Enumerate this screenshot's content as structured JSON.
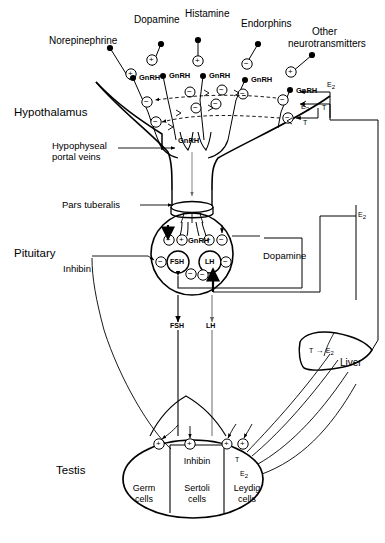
{
  "figure": {
    "type": "diagram",
    "organs": {
      "hypothalamus": "Hypothalamus",
      "pituitary": "Pituitary",
      "testis": "Testis",
      "liver": "Liver"
    },
    "neurotransmitters": [
      "Norepinephrine",
      "Dopamine",
      "Histamine",
      "Endorphins",
      "Other\nneurotransmitters"
    ],
    "nt_labels": {
      "norepinephrine": "Norepinephrine",
      "dopamine": "Dopamine",
      "histamine": "Histamine",
      "endorphins": "Endorphins",
      "other_line1": "Other",
      "other_line2": "neurotransmitters"
    },
    "annotations": {
      "portal_veins_line1": "Hypophyseal",
      "portal_veins_line2": "portal veins",
      "pars_tuberalis": "Pars tuberalis",
      "inhibin_left": "Inhibin",
      "dopamine_pituitary": "Dopamine"
    },
    "hormones": {
      "gnrh": "GnRH",
      "fsh": "FSH",
      "lh": "LH",
      "inhibin": "Inhibin",
      "testosterone": "T",
      "estradiol_t": "E",
      "estradiol_sub": "2"
    },
    "hypothalamus_gnrh_terminals": [
      "GnRH",
      "GnRH",
      "GnRH",
      "GnRH",
      "GnRH"
    ],
    "gnrh_trunk_label": "GnRH",
    "pituitary": {
      "gnrh_label": "GnRH",
      "fsh_label": "FSH",
      "lh_label": "LH",
      "dopamine_label": "Dopamine",
      "gnrh_row_signs": [
        "-",
        "+",
        "+",
        "-"
      ],
      "fsh_signs": [
        "-",
        "-"
      ],
      "lh_signs": [
        "-",
        "-"
      ]
    },
    "tract_labels": {
      "fsh": "FSH",
      "lh": "LH"
    },
    "testis": {
      "compartments": [
        {
          "line1": "Germ",
          "line2": "cells"
        },
        {
          "line1": "Sertoli",
          "line2": "cells"
        },
        {
          "line1": "Leydig",
          "line2": "cells"
        }
      ],
      "products": {
        "inhibin": "Inhibin",
        "testosterone": "T",
        "estradiol": "E",
        "estradiol_sub": "2"
      },
      "signs": [
        "+",
        "+",
        "+",
        "+"
      ]
    },
    "liver": {
      "label": "Liver",
      "conversion_from": "T",
      "conversion_arrow": "→",
      "conversion_to": "E",
      "conversion_to_sub": "2"
    },
    "feedback_labels": {
      "e2_top_right": "E",
      "e2_top_right_sub": "2",
      "e2_mid": "E",
      "e2_mid_sub": "2",
      "t_mid": "T",
      "t_lower": "T",
      "e2_right_column": "E",
      "e2_right_column_sub": "2"
    },
    "signs": {
      "plus": "+",
      "minus": "−"
    },
    "colors": {
      "ink": "#000000",
      "paper": "#ffffff",
      "grey": "#777777"
    }
  }
}
